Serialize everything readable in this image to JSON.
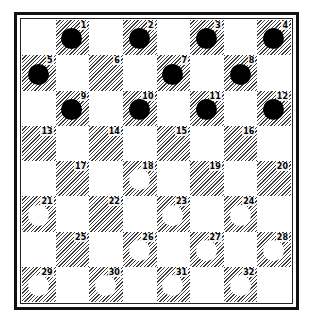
{
  "diagram": {
    "type": "checkers-board",
    "colors": {
      "frame": "#111111",
      "dark_square_hatch": "#3a3a3a",
      "light_square": "#ffffff",
      "black_piece": "#000000",
      "white_piece": "#ffffff"
    },
    "squares": [
      {
        "n": "1",
        "piece": "black"
      },
      {
        "n": "2",
        "piece": "black"
      },
      {
        "n": "3",
        "piece": "black"
      },
      {
        "n": "4",
        "piece": "black"
      },
      {
        "n": "5",
        "piece": "black"
      },
      {
        "n": "6",
        "piece": ""
      },
      {
        "n": "7",
        "piece": "black"
      },
      {
        "n": "8",
        "piece": "black"
      },
      {
        "n": "9",
        "piece": "black"
      },
      {
        "n": "10",
        "piece": "black"
      },
      {
        "n": "11",
        "piece": "black"
      },
      {
        "n": "12",
        "piece": "black"
      },
      {
        "n": "13",
        "piece": ""
      },
      {
        "n": "14",
        "piece": ""
      },
      {
        "n": "15",
        "piece": ""
      },
      {
        "n": "16",
        "piece": ""
      },
      {
        "n": "17",
        "piece": ""
      },
      {
        "n": "18",
        "piece": "white"
      },
      {
        "n": "19",
        "piece": ""
      },
      {
        "n": "20",
        "piece": ""
      },
      {
        "n": "21",
        "piece": "white"
      },
      {
        "n": "22",
        "piece": ""
      },
      {
        "n": "23",
        "piece": "white"
      },
      {
        "n": "24",
        "piece": "white"
      },
      {
        "n": "25",
        "piece": ""
      },
      {
        "n": "26",
        "piece": "white"
      },
      {
        "n": "27",
        "piece": "white"
      },
      {
        "n": "28",
        "piece": "white"
      },
      {
        "n": "29",
        "piece": "white"
      },
      {
        "n": "30",
        "piece": "white"
      },
      {
        "n": "31",
        "piece": "white"
      },
      {
        "n": "32",
        "piece": "white"
      }
    ]
  }
}
